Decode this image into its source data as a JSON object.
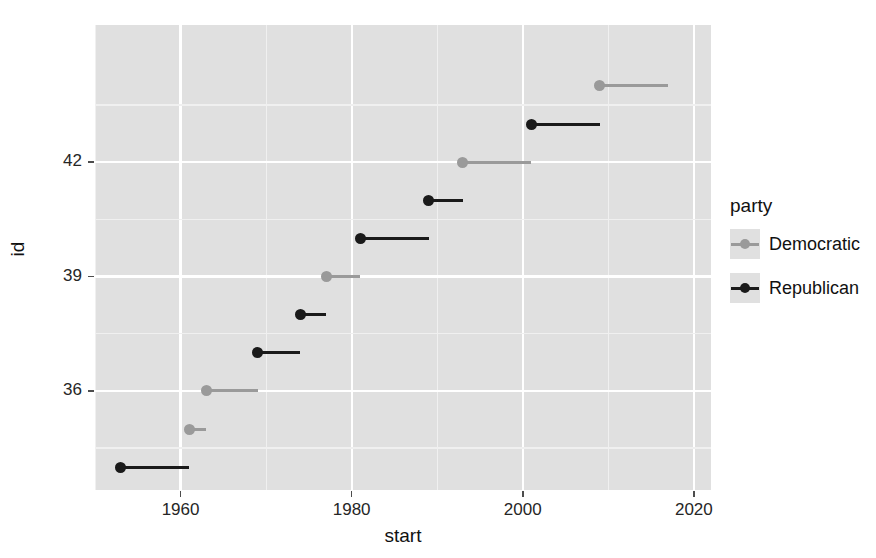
{
  "chart_data": {
    "type": "scatter",
    "title": "",
    "xlabel": "start",
    "ylabel": "id",
    "xlim": [
      1950,
      2022
    ],
    "ylim": [
      33.4,
      45.6
    ],
    "grid": true,
    "legend_position": "right",
    "legend_title": "party",
    "x_ticks": [
      1960,
      1980,
      2000,
      2020
    ],
    "x_tick_labels": [
      "1960",
      "1980",
      "2000",
      "2020"
    ],
    "x_minor_ticks": [
      1950,
      1970,
      1990,
      2010
    ],
    "y_ticks": [
      36,
      39,
      42
    ],
    "y_tick_labels": [
      "36",
      "39",
      "42"
    ],
    "y_minor_ticks": [
      34.5,
      37.5,
      40.5,
      43.5
    ],
    "series": [
      {
        "name": "Democratic",
        "color": "#9a9a9a",
        "points": [
          {
            "id": 35,
            "start": 1961,
            "end": 1963
          },
          {
            "id": 36,
            "start": 1963,
            "end": 1969
          },
          {
            "id": 39,
            "start": 1977,
            "end": 1981
          },
          {
            "id": 42,
            "start": 1993,
            "end": 2001
          },
          {
            "id": 44,
            "start": 2009,
            "end": 2017
          }
        ]
      },
      {
        "name": "Republican",
        "color": "#1a1a1a",
        "points": [
          {
            "id": 34,
            "start": 1953,
            "end": 1961
          },
          {
            "id": 37,
            "start": 1969,
            "end": 1974
          },
          {
            "id": 38,
            "start": 1974,
            "end": 1977
          },
          {
            "id": 40,
            "start": 1981,
            "end": 1989
          },
          {
            "id": 41,
            "start": 1989,
            "end": 1993
          },
          {
            "id": 43,
            "start": 2001,
            "end": 2009
          }
        ]
      }
    ]
  },
  "axes": {
    "x_title": "start",
    "y_title": "id"
  },
  "legend": {
    "title": "party",
    "entries": [
      {
        "label": "Democratic",
        "key": "dem"
      },
      {
        "label": "Republican",
        "key": "rep"
      }
    ]
  },
  "colors": {
    "panel_background": "#e0e0e0",
    "gridline_major": "#ffffff",
    "gridline_minor": "#f0f0f0",
    "democratic": "#9a9a9a",
    "republican": "#1a1a1a"
  }
}
